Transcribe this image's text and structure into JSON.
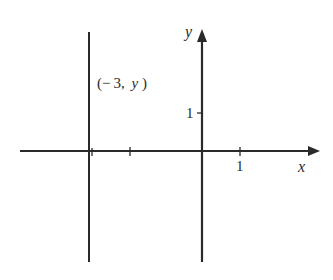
{
  "diagram": {
    "x_axis_label": "x",
    "y_axis_label": "y",
    "x_tick_label": "1",
    "y_tick_label": "1",
    "line_label": "(− 3, y)",
    "line_label_parts": {
      "open": "(− 3,",
      "var": "y",
      "close": ")"
    },
    "vertical_line_x": -3,
    "x_ticks": [
      -3,
      -2,
      1
    ],
    "y_ticks": [
      1
    ],
    "colors": {
      "stroke": "#2a2a2a",
      "background": "#ffffff"
    }
  }
}
